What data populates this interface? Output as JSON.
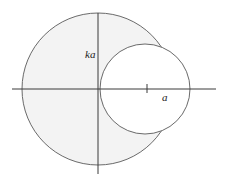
{
  "diagram": {
    "labels": {
      "ka": "ka",
      "a": "a"
    },
    "colors": {
      "stroke": "#6a6a6a",
      "axis": "#3a3a3a",
      "shade": "#f3f3f3",
      "background": "#ffffff"
    },
    "large_circle": {
      "cx": 98,
      "cy": 89,
      "r": 76,
      "shaded": true
    },
    "small_circle": {
      "cx": 145,
      "cy": 89,
      "r": 45,
      "shaded": false
    },
    "axes": {
      "horizontal": {
        "x1": 12,
        "x2": 216,
        "y": 89
      },
      "vertical": {
        "x": 98,
        "y1": 13,
        "y2": 174
      }
    },
    "tick": {
      "x": 147,
      "y1": 84,
      "y2": 93
    }
  }
}
